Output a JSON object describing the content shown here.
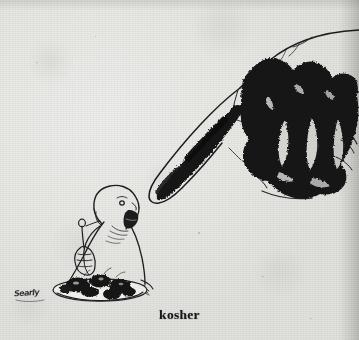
{
  "page": {
    "title": "kosher",
    "media": "scanned-cartoon-on-paper",
    "width": 359,
    "height": 340,
    "paper_color": "#e9e9e7",
    "ink_color": "#1a1a1c"
  },
  "caption": {
    "text": "kosher"
  },
  "signature": {
    "text": "Searly"
  },
  "artwork": {
    "hand": {
      "name": "pointing-hand",
      "description": "large hand with extended index finger pointing down-left, densely inked in black",
      "ink": "#131314"
    },
    "figure": {
      "name": "seated-man-eating",
      "description": "small bald bearded man in profile holding a fork, eating from a plate",
      "ink": "#1a1a1c"
    },
    "plate": {
      "name": "plate-of-food",
      "description": "oval plate with dark blobs of food"
    },
    "table_edge": {
      "name": "table-edge-line",
      "description": "short horizontal line to the right of the plate"
    }
  }
}
